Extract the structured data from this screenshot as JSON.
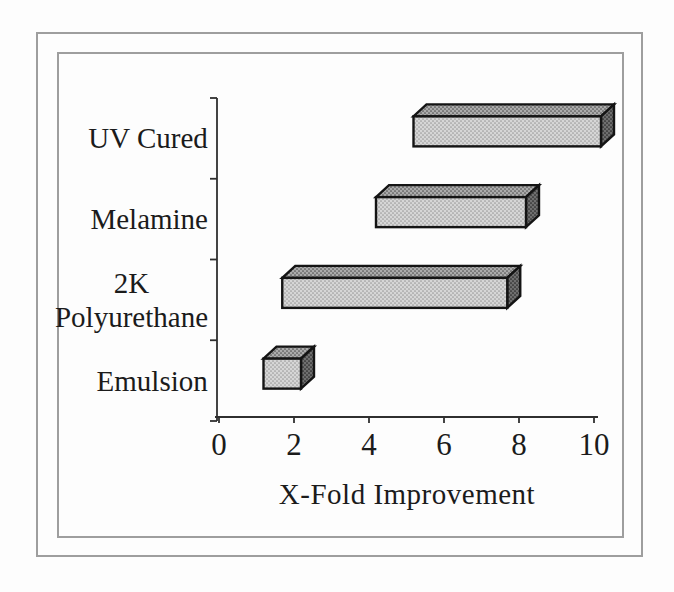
{
  "chart_data": {
    "type": "bar",
    "subtype": "3d-horizontal-floating-range",
    "title": "",
    "xlabel": "X-Fold Improvement",
    "categories": [
      "UV Cured",
      "Melamine",
      "2K Polyurethane",
      "Emulsion"
    ],
    "bars": [
      {
        "category": "UV Cured",
        "start": 5,
        "end": 10
      },
      {
        "category": "Melamine",
        "start": 4,
        "end": 8
      },
      {
        "category": "2K Polyurethane",
        "start": 1.5,
        "end": 7.5
      },
      {
        "category": "Emulsion",
        "start": 1,
        "end": 2
      }
    ],
    "xticks": [
      0,
      2,
      4,
      6,
      8,
      10
    ],
    "xlim": [
      0,
      10
    ],
    "grid": false,
    "legend": false,
    "colors": {
      "bar_front": "#d6d6d6",
      "bar_front_dot": "#9b9b9b",
      "bar_top": "#ababab",
      "bar_top_dot": "#515151",
      "bar_side": "#6f6f6f",
      "bar_side_dot": "#262626",
      "outline": "#141414",
      "axis": "#2f2f2f",
      "text": "#1b1b1b",
      "frame": "#9e9e9e",
      "background": "#fdfdfd"
    }
  }
}
